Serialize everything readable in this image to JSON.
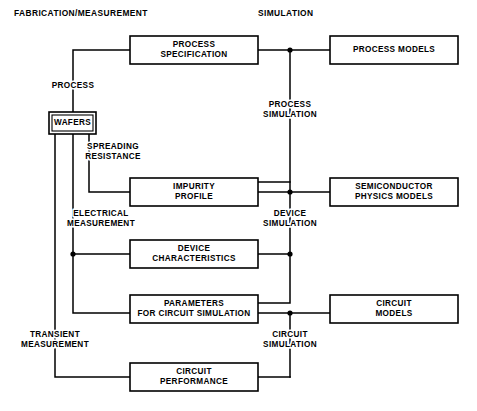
{
  "diagram": {
    "type": "block-flow-diagram",
    "background_color": "#ffffff",
    "line_color": "#000000",
    "text_color": "#000000",
    "column_headings": [
      {
        "id": "heading-fabrication",
        "label": "FABRICATION/MEASUREMENT",
        "x": 14,
        "y": 14
      },
      {
        "id": "heading-simulation",
        "label": "SIMULATION",
        "x": 258,
        "y": 14
      }
    ],
    "boxes": [
      {
        "id": "box-process-specification",
        "name": "process-specification-box",
        "lines": [
          "PROCESS",
          "SPECIFICATION"
        ],
        "x": 130,
        "y": 36,
        "w": 128,
        "h": 28,
        "double_border": false
      },
      {
        "id": "box-process-models",
        "name": "process-models-box",
        "lines": [
          "PROCESS MODELS"
        ],
        "x": 330,
        "y": 36,
        "w": 128,
        "h": 28,
        "double_border": false
      },
      {
        "id": "box-wafers",
        "name": "wafers-box",
        "lines": [
          "WAFERS"
        ],
        "x": 49,
        "y": 112,
        "w": 47,
        "h": 22,
        "double_border": true
      },
      {
        "id": "box-impurity-profile",
        "name": "impurity-profile-box",
        "lines": [
          "IMPURITY",
          "PROFILE"
        ],
        "x": 130,
        "y": 178,
        "w": 128,
        "h": 28,
        "double_border": false
      },
      {
        "id": "box-semiconductor-physics-models",
        "name": "semiconductor-physics-models-box",
        "lines": [
          "SEMICONDUCTOR",
          "PHYSICS MODELS"
        ],
        "x": 330,
        "y": 178,
        "w": 128,
        "h": 28,
        "double_border": false
      },
      {
        "id": "box-device-characteristics",
        "name": "device-characteristics-box",
        "lines": [
          "DEVICE",
          "CHARACTERISTICS"
        ],
        "x": 130,
        "y": 240,
        "w": 128,
        "h": 28,
        "double_border": false
      },
      {
        "id": "box-parameters-for-circuit-simulation",
        "name": "parameters-for-circuit-simulation-box",
        "lines": [
          "PARAMETERS",
          "FOR CIRCUIT SIMULATION"
        ],
        "x": 130,
        "y": 295,
        "w": 128,
        "h": 28,
        "double_border": false
      },
      {
        "id": "box-circuit-models",
        "name": "circuit-models-box",
        "lines": [
          "CIRCUIT",
          "MODELS"
        ],
        "x": 330,
        "y": 295,
        "w": 128,
        "h": 28,
        "double_border": false
      },
      {
        "id": "box-circuit-performance",
        "name": "circuit-performance-box",
        "lines": [
          "CIRCUIT",
          "PERFORMANCE"
        ],
        "x": 130,
        "y": 363,
        "w": 128,
        "h": 28,
        "double_border": false
      }
    ],
    "edge_labels": [
      {
        "id": "label-process",
        "name": "process-edge-label",
        "lines": [
          "PROCESS"
        ],
        "x": 73,
        "y": 86
      },
      {
        "id": "label-process-simulation",
        "name": "process-simulation-edge-label",
        "lines": [
          "PROCESS",
          "SIMULATION"
        ],
        "x": 290,
        "y": 110
      },
      {
        "id": "label-spreading-resistance",
        "name": "spreading-resistance-edge-label",
        "lines": [
          "SPREADING",
          "RESISTANCE"
        ],
        "x": 113,
        "y": 152
      },
      {
        "id": "label-electrical-measurement",
        "name": "electrical-measurement-edge-label",
        "lines": [
          "ELECTRICAL",
          "MEASUREMENT"
        ],
        "x": 101,
        "y": 219
      },
      {
        "id": "label-device-simulation",
        "name": "device-simulation-edge-label",
        "lines": [
          "DEVICE",
          "SIMULATION"
        ],
        "x": 290,
        "y": 219
      },
      {
        "id": "label-transient-measurement",
        "name": "transient-measurement-edge-label",
        "lines": [
          "TRANSIENT",
          "MEASUREMENT"
        ],
        "x": 55,
        "y": 340
      },
      {
        "id": "label-circuit-simulation",
        "name": "circuit-simulation-edge-label",
        "lines": [
          "CIRCUIT",
          "SIMULATION"
        ],
        "x": 290,
        "y": 340
      }
    ],
    "connectors": [
      {
        "id": "conn-procspec-to-wafers",
        "name": "process-path-connector",
        "points": "130,50 73,50 73,112"
      },
      {
        "id": "conn-procspec-to-procmodels",
        "name": "process-specification-to-process-models-connector",
        "points": "258,50 330,50"
      },
      {
        "id": "conn-process-simulation-vertical",
        "name": "process-simulation-vertical-connector",
        "points": "290,50 290,192"
      },
      {
        "id": "conn-wafers-spreading-resistance",
        "name": "spreading-resistance-connector",
        "points": "89,134 89,192 130,192"
      },
      {
        "id": "conn-impurity-to-semiphysics",
        "name": "impurity-profile-to-semiconductor-physics-connector",
        "points": "258,192 330,192"
      },
      {
        "id": "conn-impurity-top-right-up",
        "name": "impurity-profile-top-right-connector",
        "points": "258,182 290,182"
      },
      {
        "id": "conn-device-sim-vertical",
        "name": "device-simulation-vertical-connector",
        "points": "290,192 290,254"
      },
      {
        "id": "conn-wafers-electrical-to-device",
        "name": "electrical-measurement-connector",
        "points": "73,134 73,254 130,254"
      },
      {
        "id": "conn-devicechar-right",
        "name": "device-characteristics-right-connector",
        "points": "258,254 290,254"
      },
      {
        "id": "conn-electrical-down-to-params",
        "name": "electrical-to-parameters-connector",
        "points": "73,254 73,313 130,313"
      },
      {
        "id": "conn-params-top-right-up",
        "name": "parameters-top-right-connector",
        "points": "258,303 290,303 290,254"
      },
      {
        "id": "conn-params-to-circuitmodels",
        "name": "parameters-to-circuit-models-connector",
        "points": "258,313 330,313"
      },
      {
        "id": "conn-circuit-sim-vertical",
        "name": "circuit-simulation-vertical-connector",
        "points": "290,313 290,377"
      },
      {
        "id": "conn-circuitperf-right",
        "name": "circuit-performance-right-connector",
        "points": "258,377 290,377"
      },
      {
        "id": "conn-wafers-transient",
        "name": "transient-measurement-connector",
        "points": "55,134 55,377 130,377"
      }
    ],
    "junction_dots": [
      {
        "id": "dot-process-simulation",
        "name": "process-simulation-junction-dot",
        "x": 290,
        "y": 50,
        "r": 2.6
      },
      {
        "id": "dot-device-simulation",
        "name": "device-simulation-junction-dot",
        "x": 290,
        "y": 192,
        "r": 2.6
      },
      {
        "id": "dot-device-characteristics-right",
        "name": "device-characteristics-right-junction-dot",
        "x": 290,
        "y": 254,
        "r": 2.6
      },
      {
        "id": "dot-device-characteristics-left",
        "name": "device-characteristics-left-junction-dot",
        "x": 73,
        "y": 254,
        "r": 2.6
      },
      {
        "id": "dot-circuit-simulation",
        "name": "circuit-simulation-junction-dot",
        "x": 290,
        "y": 313,
        "r": 2.6
      }
    ]
  }
}
